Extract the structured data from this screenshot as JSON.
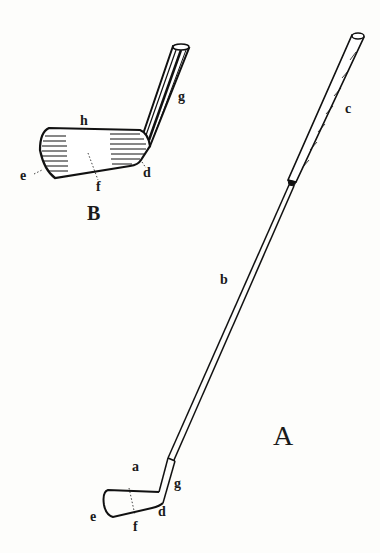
{
  "figure": {
    "views": [
      {
        "id": "A",
        "label": "A",
        "description": "Full club"
      },
      {
        "id": "B",
        "label": "B",
        "description": "Enlarged club head"
      }
    ],
    "labels_A": {
      "a": "a",
      "b": "b",
      "c": "c",
      "d": "d",
      "e": "e",
      "f": "f",
      "g": "g"
    },
    "labels_B": {
      "d": "d",
      "e": "e",
      "f": "f",
      "g": "g",
      "h": "h"
    },
    "view_A_label": "A",
    "view_B_label": "B"
  }
}
